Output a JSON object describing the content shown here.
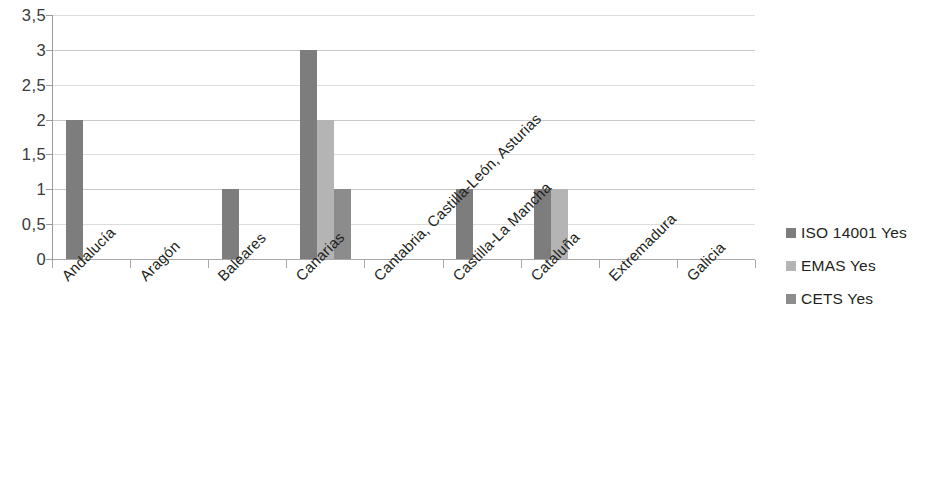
{
  "chart_data": {
    "type": "bar",
    "title": "",
    "subtitle": "",
    "xlabel": "",
    "ylabel": "",
    "ylim": [
      0,
      3.5
    ],
    "ytick_values": [
      0,
      0.5,
      1,
      1.5,
      2,
      2.5,
      3,
      3.5
    ],
    "ytick_labels": [
      "0",
      "0,5",
      "1",
      "1,5",
      "2",
      "2,5",
      "3",
      "3,5"
    ],
    "grid": true,
    "legend_position": "right",
    "categories": [
      "Andalucía",
      "Aragón",
      "Baleares",
      "Canarias",
      "Cantabria, Castilla-León, Asturias",
      "Castilla-La Mancha",
      "Cataluña",
      "Extremadura",
      "Galicia"
    ],
    "series": [
      {
        "name": "ISO 14001 Yes",
        "color": "#7d7d7d",
        "values": [
          2,
          0,
          1,
          3,
          0,
          1,
          1,
          0,
          0
        ]
      },
      {
        "name": "EMAS Yes",
        "color": "#b4b4b4",
        "values": [
          0,
          0,
          0,
          2,
          0,
          0,
          1,
          0,
          0
        ]
      },
      {
        "name": "CETS Yes",
        "color": "#8c8c8c",
        "values": [
          0,
          0,
          0,
          1,
          0,
          0,
          0,
          0,
          0
        ]
      }
    ]
  },
  "legend": {
    "items": [
      {
        "label": "ISO 14001 Yes",
        "color": "#7d7d7d"
      },
      {
        "label": "EMAS Yes",
        "color": "#b4b4b4"
      },
      {
        "label": "CETS Yes",
        "color": "#8c8c8c"
      }
    ]
  },
  "axes": {
    "y": {
      "labels": [
        "3,5",
        "3",
        "2,5",
        "2",
        "1,5",
        "1",
        "0,5",
        "0"
      ]
    }
  }
}
